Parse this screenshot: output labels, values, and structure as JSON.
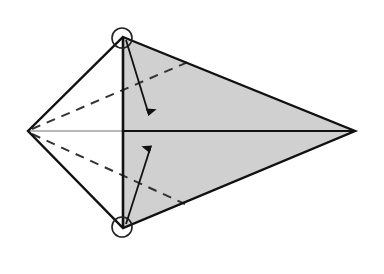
{
  "diagram": {
    "type": "origami-fold-step",
    "colors": {
      "background": "#ffffff",
      "shaded_face": "#d0d0d0",
      "outline": "#111111",
      "centerline_light": "#b8b8b8",
      "dashed": "#333333"
    },
    "points": {
      "top": [
        123,
        37
      ],
      "bottom": [
        123,
        228
      ],
      "left": [
        28,
        131
      ],
      "right": [
        355,
        131
      ]
    },
    "elements": [
      {
        "name": "shaded-right-face",
        "kind": "polygon"
      },
      {
        "name": "kite-outline",
        "kind": "polygon"
      },
      {
        "name": "vertical-center-crease",
        "kind": "line"
      },
      {
        "name": "horizontal-centerline",
        "kind": "line"
      },
      {
        "name": "upper-valley-fold-line",
        "kind": "dashed-line"
      },
      {
        "name": "lower-valley-fold-line",
        "kind": "dashed-line"
      },
      {
        "name": "top-corner-circle",
        "kind": "marker"
      },
      {
        "name": "bottom-corner-circle",
        "kind": "marker"
      },
      {
        "name": "fold-arrow-down",
        "kind": "arrow"
      },
      {
        "name": "fold-arrow-up",
        "kind": "arrow"
      }
    ]
  }
}
